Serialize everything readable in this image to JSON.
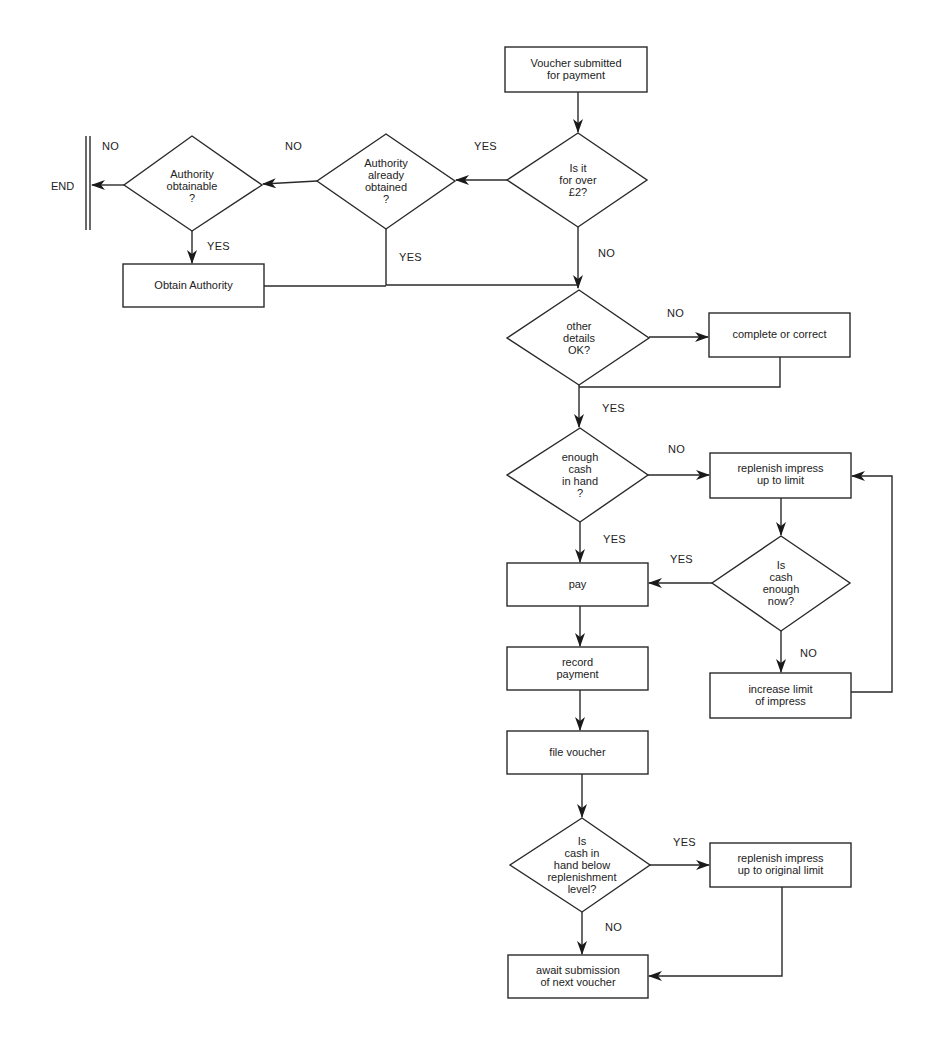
{
  "diagram": {
    "type": "flowchart",
    "nodes": {
      "start": {
        "kind": "process",
        "text": "Voucher submitted\nfor payment"
      },
      "over2": {
        "kind": "decision",
        "text": "Is it\nfor over\n£2?"
      },
      "auth_obtained": {
        "kind": "decision",
        "text": "Authority\nalready\nobtained\n?"
      },
      "auth_obtainable": {
        "kind": "decision",
        "text": "Authority\nobtainable\n?"
      },
      "end": {
        "kind": "terminator",
        "text": "END"
      },
      "obtain_auth": {
        "kind": "process",
        "text": "Obtain Authority"
      },
      "details_ok": {
        "kind": "decision",
        "text": "other\ndetails\nOK?"
      },
      "complete": {
        "kind": "process",
        "text": "complete or correct"
      },
      "enough_cash": {
        "kind": "decision",
        "text": "enough\ncash\nin hand\n?"
      },
      "replenish_limit": {
        "kind": "process",
        "text": "replenish impress\nup to limit"
      },
      "pay": {
        "kind": "process",
        "text": "pay"
      },
      "cash_enough_now": {
        "kind": "decision",
        "text": "Is\ncash\nenough\nnow?"
      },
      "record": {
        "kind": "process",
        "text": "record\npayment"
      },
      "increase_limit": {
        "kind": "process",
        "text": "increase limit\nof impress"
      },
      "file": {
        "kind": "process",
        "text": "file voucher"
      },
      "below_level": {
        "kind": "decision",
        "text": "Is\ncash in\nhand below\nreplenishment\nlevel?"
      },
      "replenish_original": {
        "kind": "process",
        "text": "replenish impress\nup to original limit"
      },
      "await": {
        "kind": "process",
        "text": "await submission\nof next voucher"
      }
    },
    "edge_labels": {
      "over2_yes": "YES",
      "over2_no": "NO",
      "auth_obtained_no": "NO",
      "auth_obtained_yes": "YES",
      "auth_obtainable_no": "NO",
      "auth_obtainable_yes": "YES",
      "details_no": "NO",
      "details_yes": "YES",
      "cash_no": "NO",
      "cash_yes": "YES",
      "enough_now_yes": "YES",
      "enough_now_no": "NO",
      "below_yes": "YES",
      "below_no": "NO"
    },
    "edges": [
      {
        "from": "start",
        "to": "over2"
      },
      {
        "from": "over2",
        "to": "auth_obtained",
        "label": "YES"
      },
      {
        "from": "over2",
        "to": "details_ok",
        "label": "NO"
      },
      {
        "from": "auth_obtained",
        "to": "auth_obtainable",
        "label": "NO"
      },
      {
        "from": "auth_obtained",
        "to": "details_ok",
        "label": "YES"
      },
      {
        "from": "auth_obtainable",
        "to": "end",
        "label": "NO"
      },
      {
        "from": "auth_obtainable",
        "to": "obtain_auth",
        "label": "YES"
      },
      {
        "from": "obtain_auth",
        "to": "details_ok"
      },
      {
        "from": "details_ok",
        "to": "complete",
        "label": "NO"
      },
      {
        "from": "complete",
        "to": "enough_cash"
      },
      {
        "from": "details_ok",
        "to": "enough_cash",
        "label": "YES"
      },
      {
        "from": "enough_cash",
        "to": "replenish_limit",
        "label": "NO"
      },
      {
        "from": "enough_cash",
        "to": "pay",
        "label": "YES"
      },
      {
        "from": "replenish_limit",
        "to": "cash_enough_now"
      },
      {
        "from": "cash_enough_now",
        "to": "pay",
        "label": "YES"
      },
      {
        "from": "cash_enough_now",
        "to": "increase_limit",
        "label": "NO"
      },
      {
        "from": "increase_limit",
        "to": "replenish_limit"
      },
      {
        "from": "pay",
        "to": "record"
      },
      {
        "from": "record",
        "to": "file"
      },
      {
        "from": "file",
        "to": "below_level"
      },
      {
        "from": "below_level",
        "to": "replenish_original",
        "label": "YES"
      },
      {
        "from": "below_level",
        "to": "await",
        "label": "NO"
      },
      {
        "from": "replenish_original",
        "to": "await"
      }
    ]
  }
}
